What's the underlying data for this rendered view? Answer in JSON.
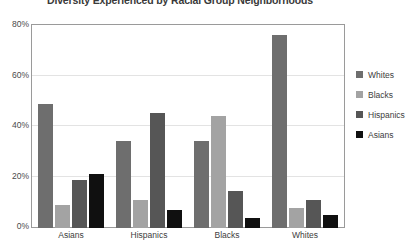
{
  "chart_data": {
    "type": "bar",
    "title": "Diversity Experienced by Racial Group Neighborhoods",
    "xlabel": "",
    "ylabel": "",
    "categories": [
      "Asians",
      "Hispanics",
      "Blacks",
      "Whites"
    ],
    "series": [
      {
        "name": "Whites",
        "color": "#6e6e6e",
        "values": [
          49,
          34.5,
          34.5,
          76.5
        ]
      },
      {
        "name": "Blacks",
        "color": "#a3a3a3",
        "values": [
          9,
          11,
          44.5,
          8
        ]
      },
      {
        "name": "Hispanics",
        "color": "#565656",
        "values": [
          19,
          45.5,
          14.5,
          11
        ]
      },
      {
        "name": "Asians",
        "color": "#101010",
        "values": [
          21.5,
          7,
          4,
          5
        ]
      }
    ],
    "ylim": [
      0,
      80
    ],
    "yticks": [
      0,
      20,
      40,
      60,
      80
    ],
    "ytick_labels": [
      "0%",
      "20%",
      "40%",
      "60%",
      "80%"
    ],
    "grid": true,
    "legend_position": "right",
    "plot_background": "#ffffff",
    "frame_color": "#9a9a9a",
    "gridline_color": "#e3e3e3"
  }
}
